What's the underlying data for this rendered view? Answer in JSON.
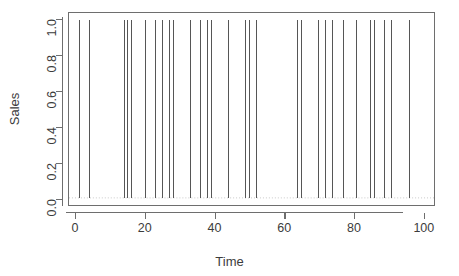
{
  "chart_data": {
    "type": "bar",
    "title": "",
    "xlabel": "Time",
    "ylabel": "Sales",
    "xlim": [
      -2.0,
      103.2
    ],
    "ylim": [
      -0.04,
      1.04
    ],
    "xticks": [
      0,
      20,
      40,
      60,
      80,
      100
    ],
    "xtick_labels": [
      "0",
      "20",
      "40",
      "60",
      "80",
      "100"
    ],
    "yticks": [
      0.0,
      0.2,
      0.4,
      0.6,
      0.8,
      1.0
    ],
    "ytick_labels": [
      "0.0",
      "0.2",
      "0.4",
      "0.6",
      "0.8",
      "1.0"
    ],
    "grid": false,
    "legend": null,
    "style": "r-base-type-h",
    "line_color": "#555555",
    "line_width": 1,
    "baseline_visible": true,
    "baseline_value": 0.0,
    "x": [
      1,
      2,
      3,
      4,
      5,
      6,
      7,
      8,
      9,
      10,
      11,
      12,
      13,
      14,
      15,
      16,
      17,
      18,
      19,
      20,
      21,
      22,
      23,
      24,
      25,
      26,
      27,
      28,
      29,
      30,
      31,
      32,
      33,
      34,
      35,
      36,
      37,
      38,
      39,
      40,
      41,
      42,
      43,
      44,
      45,
      46,
      47,
      48,
      49,
      50,
      51,
      52,
      53,
      54,
      55,
      56,
      57,
      58,
      59,
      60,
      61,
      62,
      63,
      64,
      65,
      66,
      67,
      68,
      69,
      70,
      71,
      72,
      73,
      74,
      75,
      76,
      77,
      78,
      79,
      80,
      81,
      82,
      83,
      84,
      85,
      86,
      87,
      88,
      89,
      90,
      91,
      92,
      93,
      94,
      95,
      96,
      97,
      98,
      99,
      100
    ],
    "values": [
      1,
      0,
      0,
      1,
      0,
      0,
      0,
      0,
      0,
      0,
      0,
      0,
      0,
      1,
      1,
      1,
      0,
      0,
      0,
      1,
      0,
      0,
      1,
      0,
      1,
      0,
      1,
      1,
      0,
      0,
      0,
      0,
      1,
      0,
      0,
      1,
      0,
      1,
      1,
      0,
      0,
      0,
      0,
      1,
      0,
      0,
      0,
      0,
      1,
      1,
      0,
      1,
      0,
      0,
      0,
      0,
      0,
      0,
      0,
      0,
      0,
      0,
      0,
      1,
      1,
      0,
      0,
      0,
      0,
      1,
      0,
      1,
      0,
      1,
      0,
      0,
      1,
      0,
      0,
      0,
      1,
      0,
      0,
      0,
      1,
      1,
      0,
      0,
      1,
      0,
      1,
      0,
      0,
      0,
      0,
      1,
      0,
      0,
      0,
      0
    ],
    "spike_times": [
      1,
      4,
      14,
      15,
      16,
      20,
      23,
      25,
      27,
      28,
      33,
      36,
      38,
      39,
      44,
      49,
      50,
      52,
      64,
      65,
      70,
      72,
      74,
      77,
      81,
      85,
      86,
      89,
      91,
      96
    ],
    "spike_count": 30
  }
}
